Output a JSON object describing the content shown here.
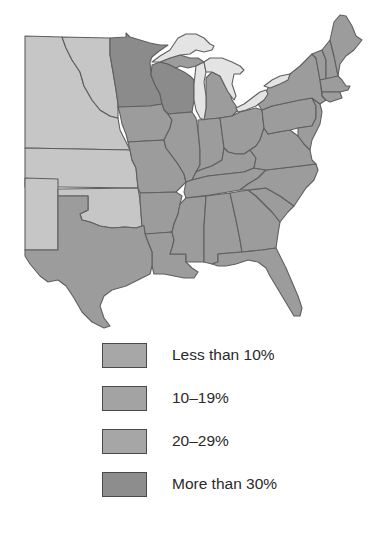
{
  "map": {
    "region": "Central and Eastern United States",
    "colors": {
      "less_than_10": "#c6c6c6",
      "10_19": "#a3a3a3",
      "20_29": "#9c9c9c",
      "more_than_30": "#8b8b8b",
      "lakes": "#e4e4e4",
      "borders": "#5f5f5f"
    },
    "states": [
      {
        "name": "North Dakota",
        "category": "Less than 10%"
      },
      {
        "name": "South Dakota",
        "category": "Less than 10%"
      },
      {
        "name": "Nebraska",
        "category": "Less than 10%"
      },
      {
        "name": "Kansas",
        "category": "Less than 10%"
      },
      {
        "name": "Oklahoma",
        "category": "Less than 10%"
      },
      {
        "name": "Colorado",
        "category": "Less than 10%"
      },
      {
        "name": "New Mexico",
        "category": "Less than 10%"
      },
      {
        "name": "Minnesota",
        "category": "More than 30%"
      },
      {
        "name": "Wisconsin",
        "category": "More than 30%"
      },
      {
        "name": "Texas",
        "category": "20–29%"
      },
      {
        "name": "Eastern states",
        "category": "20–29%"
      }
    ]
  },
  "legend": {
    "items": [
      {
        "label": "Less than 10%",
        "color": "#a7a7a7"
      },
      {
        "label": "10–19%",
        "color": "#a3a3a3"
      },
      {
        "label": "20–29%",
        "color": "#a6a6a6"
      },
      {
        "label": "More than 30%",
        "color": "#8d8d8d"
      }
    ]
  }
}
